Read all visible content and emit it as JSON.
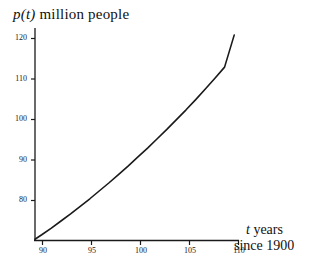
{
  "chart_data": {
    "type": "line",
    "title": "",
    "ylabel_parts": {
      "var": "p(t)",
      "text": "million people"
    },
    "ylabel": "p(t) million people",
    "xlabel_parts": {
      "line1_var": "t",
      "line1_text": "years",
      "line2_text": "since 1900"
    },
    "xlabel": "t years since 1900",
    "xlim": [
      89.3,
      110.5
    ],
    "ylim": [
      75.6,
      123.5
    ],
    "xticks": [
      90,
      95,
      100,
      105,
      110
    ],
    "xtick_labels": [
      "90",
      "95",
      "100",
      "105",
      "110"
    ],
    "yticks": [
      80,
      90,
      100,
      110,
      120
    ],
    "ytick_labels": [
      "80",
      "90",
      "100",
      "110",
      "120"
    ],
    "grid": false,
    "legend": null,
    "series": [
      {
        "name": "p(t)",
        "color": "#1a1a1a",
        "x": [
          89.3,
          90,
          91,
          92,
          93,
          94,
          95,
          96,
          97,
          98,
          99,
          100,
          101,
          102,
          103,
          104,
          105,
          106,
          107,
          108,
          109,
          110
        ],
        "y": [
          76.0,
          77.0,
          78.5,
          80.1,
          81.7,
          83.4,
          85.1,
          86.9,
          88.7,
          90.6,
          92.5,
          94.5,
          96.5,
          98.6,
          100.7,
          102.9,
          105.1,
          107.4,
          109.8,
          112.2,
          114.7,
          121.9
        ]
      }
    ]
  },
  "axes": {
    "line_color": "#1a1a1a",
    "tick_color": "#1a1a1a"
  }
}
